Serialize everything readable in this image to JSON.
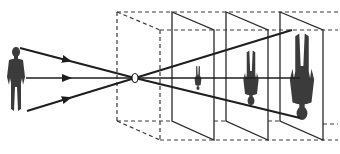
{
  "diagram": {
    "type": "pinhole-camera-projection",
    "colors": {
      "background": "#ffffff",
      "lines": "#1e1e1e",
      "figure": "#3b3b3b"
    },
    "elements": {
      "object": "standing-person-silhouette",
      "rays": [
        "top-ray",
        "center-ray",
        "bottom-ray"
      ],
      "aperture": "pinhole",
      "enclosure": "dashed-box",
      "image_planes": [
        {
          "label": "plane-1",
          "image": "small-inverted-person"
        },
        {
          "label": "plane-2",
          "image": "medium-inverted-person"
        },
        {
          "label": "plane-3",
          "image": "large-inverted-person"
        }
      ]
    },
    "text": []
  }
}
